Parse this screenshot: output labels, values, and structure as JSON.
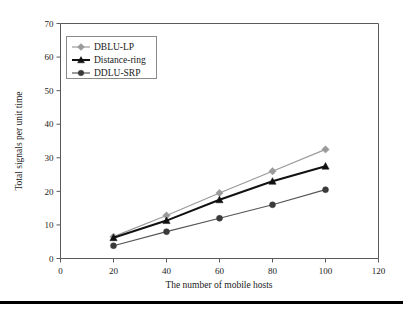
{
  "chart_data": {
    "type": "line",
    "title": "",
    "xlabel": "The number of mobile hosts",
    "ylabel": "Total signals per unit time",
    "x": [
      20,
      40,
      60,
      80,
      100
    ],
    "xlim": [
      0,
      120
    ],
    "ylim": [
      0,
      70
    ],
    "xticks": [
      0,
      20,
      40,
      60,
      80,
      100,
      120
    ],
    "yticks": [
      0,
      10,
      20,
      30,
      40,
      50,
      60,
      70
    ],
    "grid": false,
    "legend_position": "upper-left",
    "series": [
      {
        "name": "DBLU-LP",
        "values": [
          6.5,
          12.8,
          19.5,
          26.0,
          32.5
        ],
        "color": "#9a9a9a",
        "marker": "diamond"
      },
      {
        "name": "Distance-ring",
        "values": [
          6.2,
          11.3,
          17.5,
          23.0,
          27.5
        ],
        "color": "#111111",
        "marker": "triangle"
      },
      {
        "name": "DDLU-SRP",
        "values": [
          3.8,
          8.0,
          12.0,
          16.0,
          20.5
        ],
        "color": "#3a3a3a",
        "marker": "circle"
      }
    ]
  },
  "axis": {
    "x_tick_labels": [
      "0",
      "20",
      "40",
      "60",
      "80",
      "100",
      "120"
    ],
    "y_tick_labels": [
      "0",
      "10",
      "20",
      "30",
      "40",
      "50",
      "60",
      "70"
    ],
    "x_title": "The number of mobile hosts",
    "y_title": "Total signals per unit time"
  },
  "legend": {
    "entries": [
      {
        "label": "DBLU-LP"
      },
      {
        "label": "Distance-ring"
      },
      {
        "label": "DDLU-SRP"
      }
    ]
  }
}
